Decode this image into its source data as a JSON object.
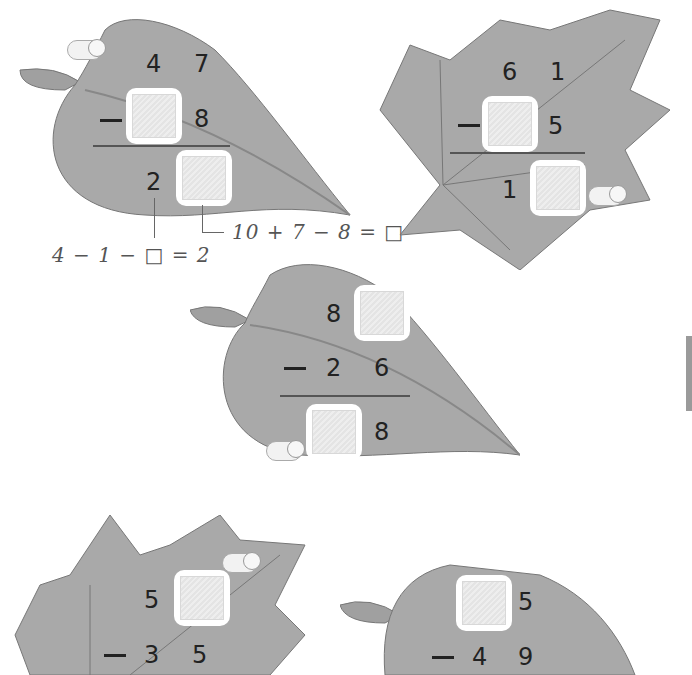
{
  "problems": [
    {
      "id": "p1",
      "top": [
        "4",
        "7"
      ],
      "sub": [
        "",
        "8"
      ],
      "result": [
        "2",
        ""
      ],
      "blanks": [
        "sub_tens",
        "result_ones"
      ]
    },
    {
      "id": "p2",
      "top": [
        "6",
        "1"
      ],
      "sub": [
        "",
        "5"
      ],
      "result": [
        "1",
        ""
      ],
      "blanks": [
        "sub_tens",
        "result_ones"
      ]
    },
    {
      "id": "p3",
      "top": [
        "8",
        ""
      ],
      "sub": [
        "2",
        "6"
      ],
      "result": [
        "",
        "8"
      ],
      "blanks": [
        "top_ones",
        "result_tens"
      ]
    },
    {
      "id": "p4",
      "top": [
        "5",
        ""
      ],
      "sub": [
        "3",
        "5"
      ],
      "result": [],
      "blanks": [
        "top_ones"
      ]
    },
    {
      "id": "p5",
      "top": [
        "",
        "5"
      ],
      "sub": [
        "4",
        "9"
      ],
      "result": [],
      "blanks": [
        "top_tens"
      ]
    }
  ],
  "hints": {
    "ones_hint": "10 + 7 − 8 = □",
    "tens_hint": "4 − 1 − □ = 2"
  },
  "operator": "−",
  "colors": {
    "leaf": "#a9a9a9",
    "leaf_dark": "#8f8f8f",
    "vein": "#7a7a7a",
    "digit": "#222222"
  }
}
